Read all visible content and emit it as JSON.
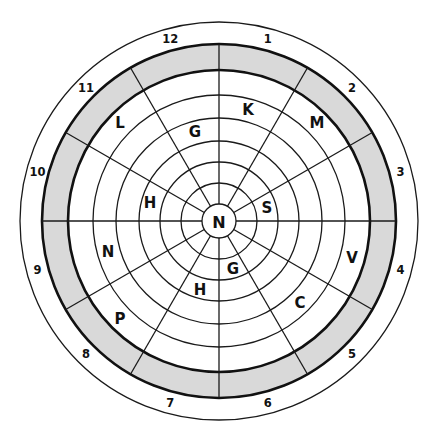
{
  "diagram": {
    "type": "circular-letter-wheel",
    "center": {
      "x": 219,
      "y": 221
    },
    "colors": {
      "line": "#1a1a1a",
      "band_fill": "#d9d9d9",
      "background": "#ffffff"
    },
    "radii": {
      "outer": 199,
      "band_outer": 177,
      "band_inner": 151,
      "inner_rings": [
        126,
        103,
        80,
        59,
        38
      ],
      "center_circle": 17
    },
    "spoke_angles_deg": [
      0,
      30,
      60,
      90,
      120,
      150,
      180,
      210,
      240,
      270,
      300,
      330
    ],
    "center_letter": "N",
    "sector_numbers": [
      {
        "label": "1",
        "angle": 15
      },
      {
        "label": "2",
        "angle": 45
      },
      {
        "label": "3",
        "angle": 75
      },
      {
        "label": "4",
        "angle": 105
      },
      {
        "label": "5",
        "angle": 135
      },
      {
        "label": "6",
        "angle": 165
      },
      {
        "label": "7",
        "angle": 195
      },
      {
        "label": "8",
        "angle": 225
      },
      {
        "label": "9",
        "angle": 255
      },
      {
        "label": "10",
        "angle": 285
      },
      {
        "label": "11",
        "angle": 315
      },
      {
        "label": "12",
        "angle": 345
      }
    ],
    "number_radius": 188,
    "letters": [
      {
        "label": "K",
        "x": 248,
        "y": 110
      },
      {
        "label": "M",
        "x": 317,
        "y": 123
      },
      {
        "label": "L",
        "x": 120,
        "y": 123
      },
      {
        "label": "G",
        "x": 195,
        "y": 132
      },
      {
        "label": "H",
        "x": 150,
        "y": 203
      },
      {
        "label": "S",
        "x": 267,
        "y": 208
      },
      {
        "label": "N",
        "x": 108,
        "y": 252
      },
      {
        "label": "V",
        "x": 352,
        "y": 258
      },
      {
        "label": "G",
        "x": 233,
        "y": 269
      },
      {
        "label": "H",
        "x": 200,
        "y": 290
      },
      {
        "label": "C",
        "x": 300,
        "y": 303
      },
      {
        "label": "P",
        "x": 120,
        "y": 319
      }
    ]
  }
}
